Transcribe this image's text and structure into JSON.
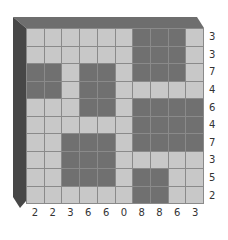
{
  "puzzle": {
    "type": "nonogram-count",
    "rows": 10,
    "cols": 10,
    "grid": [
      [
        0,
        0,
        0,
        0,
        0,
        0,
        1,
        1,
        1,
        0
      ],
      [
        0,
        0,
        0,
        0,
        0,
        0,
        1,
        1,
        1,
        0
      ],
      [
        1,
        1,
        0,
        1,
        1,
        0,
        1,
        1,
        1,
        0
      ],
      [
        1,
        1,
        0,
        1,
        1,
        0,
        0,
        0,
        0,
        0
      ],
      [
        0,
        0,
        0,
        1,
        1,
        0,
        1,
        1,
        1,
        1
      ],
      [
        0,
        0,
        0,
        0,
        0,
        0,
        1,
        1,
        1,
        1
      ],
      [
        0,
        0,
        1,
        1,
        1,
        0,
        1,
        1,
        1,
        1
      ],
      [
        0,
        0,
        1,
        1,
        1,
        0,
        0,
        0,
        0,
        0
      ],
      [
        0,
        0,
        1,
        1,
        1,
        0,
        1,
        1,
        0,
        0
      ],
      [
        0,
        0,
        0,
        0,
        0,
        0,
        1,
        1,
        0,
        0
      ]
    ],
    "row_clues": [
      "3",
      "3",
      "7",
      "4",
      "6",
      "4",
      "7",
      "3",
      "5",
      "2"
    ],
    "col_clues": [
      "2",
      "2",
      "3",
      "6",
      "6",
      "0",
      "8",
      "8",
      "6",
      "3"
    ],
    "colors": {
      "filled": "#707070",
      "empty": "#c8c8c8",
      "grid_line": "#8a8a8a",
      "bevel_top": "#6e6e6e",
      "bevel_left": "#474747"
    }
  }
}
